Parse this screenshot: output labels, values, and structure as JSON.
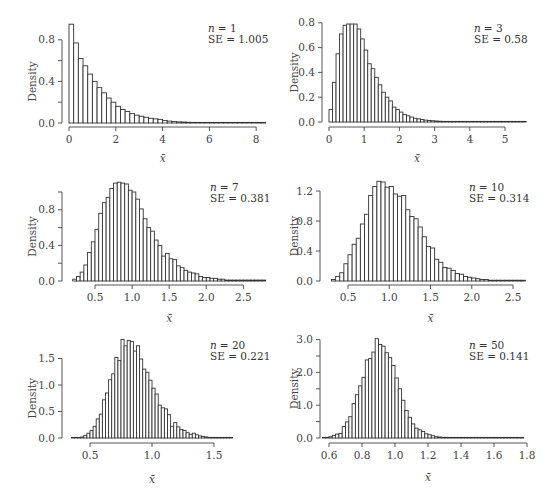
{
  "figure": {
    "panel_count": 6
  },
  "chart_data": [
    {
      "type": "bar",
      "subtype": "histogram",
      "annotation": {
        "n_label": "n",
        "n_value": "= 1",
        "se_text": "SE = 1.005"
      },
      "xlabel": "x̄",
      "ylabel": "Density",
      "xticks": [
        "0",
        "2",
        "4",
        "6",
        "8"
      ],
      "xtick_values": [
        0,
        2,
        4,
        6,
        8
      ],
      "yticks": [
        "0.0",
        "0.4",
        "0.8"
      ],
      "ytick_values": [
        0.0,
        0.4,
        0.8
      ],
      "ytick_minor": [
        0.2,
        0.6
      ],
      "xlim": [
        0,
        8.4
      ],
      "ylim": [
        0,
        0.95
      ],
      "bin_start": 0,
      "bin_width": 0.2,
      "values": [
        0.95,
        0.77,
        0.62,
        0.55,
        0.47,
        0.4,
        0.34,
        0.29,
        0.24,
        0.2,
        0.16,
        0.13,
        0.11,
        0.09,
        0.075,
        0.065,
        0.055,
        0.045,
        0.04,
        0.035,
        0.025,
        0.018,
        0.014,
        0.011,
        0.009,
        0.007,
        0.006,
        0.005,
        0.004,
        0.003,
        0.003,
        0.002,
        0.002,
        0.002,
        0.001,
        0.001,
        0.001,
        0.001,
        0.001,
        0.001,
        0.001,
        0.001
      ]
    },
    {
      "type": "bar",
      "subtype": "histogram",
      "annotation": {
        "n_label": "n",
        "n_value": "= 3",
        "se_text": "SE = 0.58"
      },
      "xlabel": "x̄",
      "ylabel": "Density",
      "xticks": [
        "0",
        "1",
        "2",
        "3",
        "4",
        "5"
      ],
      "xtick_values": [
        0,
        1,
        2,
        3,
        4,
        5
      ],
      "yticks": [
        "0.0",
        "0.2",
        "0.4",
        "0.6",
        "0.8"
      ],
      "ytick_values": [
        0.0,
        0.2,
        0.4,
        0.6,
        0.8
      ],
      "xlim": [
        0,
        5.6
      ],
      "ylim": [
        0,
        0.8
      ],
      "bin_start": 0.0,
      "bin_width": 0.1,
      "values": [
        0.1,
        0.32,
        0.55,
        0.71,
        0.78,
        0.79,
        0.79,
        0.79,
        0.75,
        0.67,
        0.58,
        0.47,
        0.43,
        0.36,
        0.3,
        0.24,
        0.2,
        0.17,
        0.12,
        0.1,
        0.08,
        0.06,
        0.05,
        0.04,
        0.03,
        0.025,
        0.02,
        0.015,
        0.012,
        0.01,
        0.008,
        0.006,
        0.005,
        0.004,
        0.003,
        0.003,
        0.002,
        0.002,
        0.002,
        0.001,
        0.001,
        0.001,
        0.001,
        0.001,
        0.001,
        0.001,
        0.001,
        0.001,
        0.001,
        0.001,
        0.001,
        0.001,
        0.001,
        0.001,
        0.001,
        0.001
      ]
    },
    {
      "type": "bar",
      "subtype": "histogram",
      "annotation": {
        "n_label": "n",
        "n_value": "= 7",
        "se_text": "SE = 0.381"
      },
      "xlabel": "x̄",
      "ylabel": "Density",
      "xticks": [
        "0.5",
        "1.0",
        "1.5",
        "2.0",
        "2.5"
      ],
      "xtick_values": [
        0.5,
        1.0,
        1.5,
        2.0,
        2.5
      ],
      "yticks": [
        "0.0",
        "0.4",
        "0.8"
      ],
      "ytick_values": [
        0.0,
        0.4,
        0.8
      ],
      "ytick_minor": [
        0.2,
        0.6,
        1.0
      ],
      "xlim": [
        0.15,
        2.85
      ],
      "ylim": [
        0,
        1.0
      ],
      "bin_start": 0.2,
      "bin_width": 0.05,
      "values": [
        0.02,
        0.05,
        0.1,
        0.18,
        0.32,
        0.44,
        0.58,
        0.76,
        0.88,
        0.94,
        1.04,
        1.1,
        1.11,
        1.1,
        1.09,
        1.02,
        1.0,
        0.92,
        0.81,
        0.7,
        0.6,
        0.56,
        0.46,
        0.4,
        0.28,
        0.31,
        0.25,
        0.24,
        0.17,
        0.15,
        0.12,
        0.1,
        0.09,
        0.08,
        0.05,
        0.04,
        0.04,
        0.03,
        0.03,
        0.02,
        0.02,
        0.01,
        0.01,
        0.01,
        0.01,
        0.01,
        0.01,
        0.01,
        0.01,
        0.01,
        0.01,
        0.01,
        0.01
      ]
    },
    {
      "type": "bar",
      "subtype": "histogram",
      "annotation": {
        "n_label": "n",
        "n_value": "= 10",
        "se_text": "SE = 0.314"
      },
      "xlabel": "x̄",
      "ylabel": "Density",
      "xticks": [
        "0.5",
        "1.0",
        "1.5",
        "2.0",
        "2.5"
      ],
      "xtick_values": [
        0.5,
        1.0,
        1.5,
        2.0,
        2.5
      ],
      "yticks": [
        "0.0",
        "0.4",
        "0.8",
        "1.2"
      ],
      "ytick_values": [
        0.0,
        0.4,
        0.8,
        1.2
      ],
      "xlim": [
        0.28,
        2.65
      ],
      "ylim": [
        0,
        1.3
      ],
      "bin_start": 0.3,
      "bin_width": 0.05,
      "values": [
        0.02,
        0.06,
        0.11,
        0.23,
        0.35,
        0.49,
        0.57,
        0.76,
        0.89,
        1.14,
        1.26,
        1.33,
        1.32,
        1.25,
        1.26,
        1.16,
        1.13,
        1.14,
        0.95,
        0.86,
        0.83,
        0.72,
        0.59,
        0.46,
        0.44,
        0.29,
        0.25,
        0.18,
        0.17,
        0.14,
        0.1,
        0.09,
        0.06,
        0.05,
        0.04,
        0.03,
        0.02,
        0.02,
        0.01,
        0.01,
        0.01,
        0.01,
        0.01,
        0.01,
        0.01,
        0.01,
        0.01
      ]
    },
    {
      "type": "bar",
      "subtype": "histogram",
      "annotation": {
        "n_label": "n",
        "n_value": "= 20",
        "se_text": "SE = 0.221"
      },
      "xlabel": "x̄",
      "ylabel": "Density",
      "xticks": [
        "0.5",
        "1.0",
        "1.5"
      ],
      "xtick_values": [
        0.5,
        1.0,
        1.5
      ],
      "yticks": [
        "0.0",
        "0.5",
        "1.0",
        "1.5"
      ],
      "ytick_values": [
        0.0,
        0.5,
        1.0,
        1.5
      ],
      "xlim": [
        0.35,
        1.9
      ],
      "ylim": [
        0,
        1.85
      ],
      "bin_start": 0.35,
      "bin_width": 0.025,
      "values": [
        0.01,
        0.01,
        0.01,
        0.02,
        0.05,
        0.09,
        0.14,
        0.22,
        0.36,
        0.45,
        0.72,
        0.85,
        1.1,
        1.21,
        1.52,
        1.46,
        1.86,
        1.74,
        1.84,
        1.82,
        1.64,
        1.74,
        1.49,
        1.3,
        1.24,
        1.09,
        0.94,
        0.83,
        0.62,
        0.57,
        0.55,
        0.44,
        0.22,
        0.29,
        0.21,
        0.16,
        0.14,
        0.1,
        0.07,
        0.09,
        0.06,
        0.04,
        0.03,
        0.02,
        0.01,
        0.01,
        0.01,
        0.01,
        0.01,
        0.01,
        0.01,
        0.01
      ]
    },
    {
      "type": "bar",
      "subtype": "histogram",
      "annotation": {
        "n_label": "n",
        "n_value": "= 50",
        "se_text": "SE = 0.141"
      },
      "xlabel": "x̄",
      "ylabel": "Density",
      "xticks": [
        "0.6",
        "0.8",
        "1.0",
        "1.2",
        "1.4",
        "1.6",
        "1.8"
      ],
      "xtick_values": [
        0.6,
        0.8,
        1.0,
        1.2,
        1.4,
        1.6,
        1.8
      ],
      "yticks": [
        "0.0",
        "1.0",
        "2.0",
        "3.0"
      ],
      "ytick_values": [
        0.0,
        1.0,
        2.0,
        3.0
      ],
      "ytick_minor": [
        0.5,
        1.5,
        2.5
      ],
      "xlim": [
        0.55,
        1.8
      ],
      "ylim": [
        0,
        3.0
      ],
      "bin_start": 0.56,
      "bin_width": 0.02,
      "values": [
        0.01,
        0.02,
        0.04,
        0.08,
        0.12,
        0.14,
        0.35,
        0.49,
        0.65,
        1.05,
        1.32,
        1.59,
        1.85,
        2.38,
        2.42,
        2.62,
        3.03,
        2.85,
        2.8,
        2.6,
        2.45,
        2.21,
        1.83,
        1.5,
        1.15,
        0.84,
        0.63,
        0.43,
        0.3,
        0.25,
        0.2,
        0.13,
        0.1,
        0.07,
        0.04,
        0.03,
        0.02,
        0.02,
        0.01,
        0.01,
        0.01,
        0.01,
        0.01,
        0.01,
        0.01,
        0.01,
        0.01,
        0.01,
        0.01,
        0.01,
        0.01,
        0.01,
        0.01,
        0.01,
        0.01,
        0.01,
        0.01,
        0.01,
        0.01,
        0.01,
        0.01
      ]
    }
  ],
  "layout": {
    "panels": [
      {
        "plot_left": 69,
        "plot_right": 266,
        "xmin": 0,
        "xmax": 8.4,
        "x0": 69,
        "x_scale": 23.4,
        "yaxis_x": 62,
        "baseline_y": 123,
        "y_scale": 104,
        "xaxis_y": 127,
        "ylabel_x": 22,
        "xlabel_y": 162,
        "annot_x": 208,
        "annot_y": 32
      },
      {
        "plot_left": 329,
        "plot_right": 525,
        "xmin": 0,
        "xmax": 5.6,
        "x0": 329,
        "x_scale": 35.2,
        "yaxis_x": 322,
        "baseline_y": 122,
        "y_scale": 124,
        "xaxis_y": 127,
        "ylabel_x": 284,
        "xlabel_y": 162,
        "annot_x": 474,
        "annot_y": 32
      },
      {
        "plot_left": 69,
        "plot_right": 266,
        "xmin": 0.2,
        "xmax": 2.85,
        "x0": 95,
        "x0_val": 0.5,
        "x_scale": 74.2,
        "yaxis_x": 62,
        "baseline_y": 281,
        "y_scale": 89,
        "xaxis_y": 285,
        "ylabel_x": 22,
        "xlabel_y": 322,
        "annot_x": 210,
        "annot_y": 191
      },
      {
        "plot_left": 329,
        "plot_right": 525,
        "xmin": 0.28,
        "xmax": 2.65,
        "x0": 348,
        "x0_val": 0.5,
        "x_scale": 82.5,
        "yaxis_x": 320,
        "baseline_y": 281,
        "y_scale": 75,
        "xaxis_y": 285,
        "ylabel_x": 284,
        "xlabel_y": 322,
        "annot_x": 469,
        "annot_y": 191
      },
      {
        "plot_left": 69,
        "plot_right": 266,
        "xmin": 0.35,
        "xmax": 1.9,
        "x0": 90,
        "x0_val": 0.5,
        "x_scale": 124,
        "yaxis_x": 62,
        "baseline_y": 438,
        "y_scale": 53,
        "xaxis_y": 443,
        "ylabel_x": 22,
        "xlabel_y": 483,
        "annot_x": 210,
        "annot_y": 349
      },
      {
        "plot_left": 329,
        "plot_right": 525,
        "xmin": 0.55,
        "xmax": 1.8,
        "x0": 329,
        "x0_val": 0.6,
        "x_scale": 165,
        "yaxis_x": 320,
        "baseline_y": 438,
        "y_scale": 32.8,
        "xaxis_y": 443,
        "ylabel_x": 284,
        "xlabel_y": 481,
        "annot_x": 469,
        "annot_y": 349
      }
    ]
  }
}
